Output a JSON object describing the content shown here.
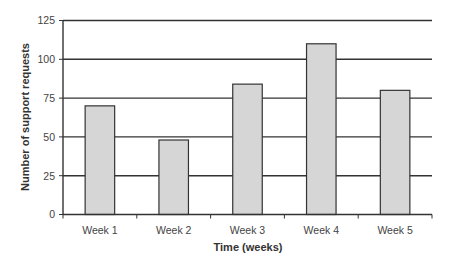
{
  "chart_data": {
    "type": "bar",
    "title": "",
    "xlabel": "Time (weeks)",
    "ylabel": "Number of support requests",
    "categories": [
      "Week 1",
      "Week 2",
      "Week 3",
      "Week 4",
      "Week 5"
    ],
    "values": [
      70,
      48,
      84,
      110,
      80
    ],
    "ylim": [
      0,
      125
    ],
    "yticks": [
      0,
      25,
      50,
      75,
      100,
      125
    ],
    "grid": "horizontal",
    "legend": "none",
    "colors": {
      "bar_fill": "#d6d6d6",
      "bar_stroke": "#333333",
      "gridline": "#333333",
      "axis": "#333333"
    }
  }
}
